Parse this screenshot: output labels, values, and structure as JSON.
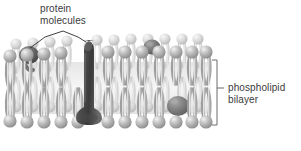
{
  "figure": {
    "background_color": "#ffffff"
  },
  "labels": {
    "protein": {
      "line1": "protein",
      "line2": "molecules",
      "text": "protein molecules",
      "color": "#3b3b3b"
    },
    "bilayer": {
      "line1": "phospholipid",
      "line2": "bilayer",
      "text": "phospholipid bilayer",
      "color": "#3b3b3b"
    }
  },
  "annotations": {
    "leader_line_color": "#2b2b2b",
    "bracket_color": "#6b6b6b",
    "leader_left_target": "left-surface-protein",
    "leader_right_target": "transmembrane-protein"
  },
  "structures": {
    "bilayer": {
      "name": "phospholipid bilayer",
      "head_color": "#a9a9a9",
      "head_highlight": "#e8e8e8",
      "tail_color": "#c9c9c9",
      "core_color": "#efefef",
      "layers": 2,
      "heads_per_row": 16
    },
    "proteins": [
      {
        "name": "transmembrane-protein",
        "shape": "capsule",
        "color": "#5a5a5a",
        "spans_bilayer": true
      },
      {
        "name": "left-surface-protein",
        "shape": "globular",
        "color": "#6e6e6e",
        "spans_bilayer": false
      },
      {
        "name": "top-surface-protein",
        "shape": "globular",
        "color": "#707070",
        "spans_bilayer": false
      },
      {
        "name": "embedded-protein-right",
        "shape": "globular",
        "color": "#7a7a7a",
        "spans_bilayer": false
      }
    ]
  }
}
